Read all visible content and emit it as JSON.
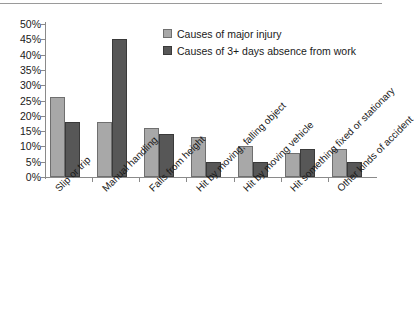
{
  "chart_data": {
    "type": "bar",
    "title": "",
    "subtitle": "",
    "xlabel": "",
    "ylabel": "",
    "ylim": [
      0,
      50
    ],
    "ytick_labels": [
      "50%",
      "45%",
      "40%",
      "35%",
      "30%",
      "25%",
      "20%",
      "15%",
      "10%",
      "5%",
      "0%"
    ],
    "ytick_values": [
      50,
      45,
      40,
      35,
      30,
      25,
      20,
      15,
      10,
      5,
      0
    ],
    "grid": false,
    "legend_position": "top-right",
    "categories": [
      "Slip or trip",
      "Manual handling",
      "Falls from height",
      "Hit by moving, falling object",
      "Hit by moving vehicle",
      "Hit something fixed or stationary",
      "Other kinds of accident"
    ],
    "series": [
      {
        "name": "Causes of major injury",
        "color": "#a8a8a8",
        "values": [
          26,
          18,
          16,
          13,
          10,
          8,
          9
        ]
      },
      {
        "name": "Causes of 3+ days absence from work",
        "color": "#575757",
        "values": [
          18,
          45,
          14,
          5,
          5,
          9,
          5
        ]
      }
    ]
  },
  "colors": {
    "series_light": "#a8a8a8",
    "series_dark": "#575757",
    "axis": "#8a8a8a",
    "text": "#1a1a1a",
    "background": "#ffffff"
  }
}
